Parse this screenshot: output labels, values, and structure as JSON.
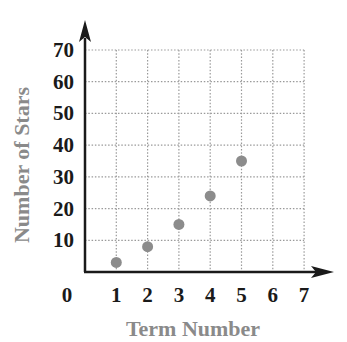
{
  "chart_data": {
    "type": "scatter",
    "title": "",
    "xlabel": "Term Number",
    "ylabel": "Number of Stars",
    "x": [
      1,
      2,
      3,
      4,
      5
    ],
    "series": [
      {
        "name": "Number of Stars",
        "values": [
          3,
          8,
          15,
          24,
          35
        ]
      }
    ],
    "x_ticks": [
      "0",
      "1",
      "2",
      "3",
      "4",
      "5",
      "6",
      "7"
    ],
    "y_ticks": [
      "10",
      "20",
      "30",
      "40",
      "50",
      "60",
      "70"
    ],
    "xlim": [
      0,
      7
    ],
    "ylim": [
      0,
      70
    ],
    "grid": true,
    "grid_style": "dotted",
    "legend": "none",
    "colors": {
      "point": "#8c8c8c",
      "axis": "#1a1a1a",
      "grid": "#9a9a9a",
      "label": "#8a8a8a"
    }
  }
}
